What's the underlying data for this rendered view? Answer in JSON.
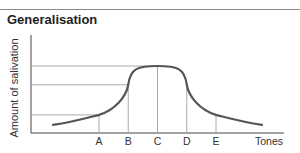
{
  "figure": {
    "title": "Generalisation",
    "ylabel": "Amount of salivation",
    "xlabel": "Tones",
    "ticks": [
      "A",
      "B",
      "C",
      "D",
      "E"
    ],
    "curve_color": "#555555",
    "line_color": "#aaaaaa"
  },
  "chart_data": {
    "type": "line",
    "title": "Generalisation",
    "xlabel": "Tones",
    "ylabel": "Amount of salivation",
    "categories": [
      "A",
      "B",
      "C",
      "D",
      "E"
    ],
    "series": [
      {
        "name": "Salivation response",
        "x": [
          0.2,
          1,
          2,
          3,
          4,
          5,
          5.6
        ],
        "values": [
          0.12,
          0.27,
          0.72,
          1.0,
          0.72,
          0.27,
          0.12
        ]
      }
    ],
    "reference_levels": [
      {
        "tone": "A",
        "value": 0.27
      },
      {
        "tone": "B",
        "value": 0.72
      },
      {
        "tone": "C",
        "value": 1.0
      }
    ],
    "grid": false
  }
}
